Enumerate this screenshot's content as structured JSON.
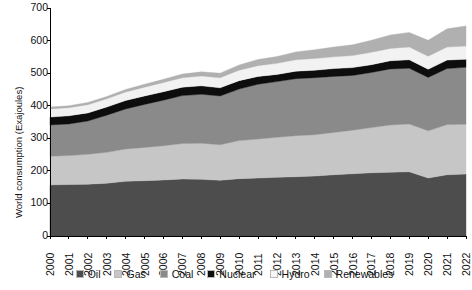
{
  "chart_data": {
    "type": "area",
    "stacked": true,
    "title": "",
    "xlabel": "",
    "ylabel": "World consumption (Exajoules)",
    "ylim": [
      0,
      700
    ],
    "yticks": [
      0,
      100,
      200,
      300,
      400,
      500,
      600,
      700
    ],
    "grid": false,
    "legend_position": "bottom",
    "x": [
      2000,
      2001,
      2002,
      2003,
      2004,
      2005,
      2006,
      2007,
      2008,
      2009,
      2010,
      2011,
      2012,
      2013,
      2014,
      2015,
      2016,
      2017,
      2018,
      2019,
      2020,
      2021,
      2022
    ],
    "categories": [
      "2000",
      "2001",
      "2002",
      "2003",
      "2004",
      "2005",
      "2006",
      "2007",
      "2008",
      "2009",
      "2010",
      "2011",
      "2012",
      "2013",
      "2014",
      "2015",
      "2016",
      "2017",
      "2018",
      "2019",
      "2020",
      "2021",
      "2022"
    ],
    "series": [
      {
        "name": "Oil",
        "color": "#4d4d4d",
        "values": [
          157,
          158,
          159,
          162,
          168,
          170,
          172,
          175,
          174,
          171,
          176,
          178,
          180,
          182,
          184,
          188,
          191,
          194,
          196,
          197,
          178,
          188,
          190
        ]
      },
      {
        "name": "Gas",
        "color": "#c6c6c6",
        "values": [
          88,
          89,
          92,
          95,
          99,
          102,
          105,
          109,
          111,
          109,
          117,
          120,
          123,
          126,
          127,
          130,
          134,
          139,
          145,
          147,
          145,
          154,
          153
        ]
      },
      {
        "name": "Coal",
        "color": "#8a8a8a",
        "values": [
          96,
          97,
          102,
          114,
          123,
          132,
          140,
          147,
          150,
          150,
          158,
          168,
          171,
          175,
          175,
          172,
          168,
          169,
          172,
          171,
          164,
          172,
          175
        ]
      },
      {
        "name": "Nuclear",
        "color": "#0d0d0d",
        "values": [
          24,
          25,
          25,
          25,
          26,
          26,
          26,
          26,
          26,
          25,
          26,
          24,
          22,
          23,
          23,
          24,
          24,
          24,
          25,
          26,
          25,
          26,
          25
        ]
      },
      {
        "name": "Hydro",
        "color": "#f2f2f2",
        "values": [
          25,
          25,
          25,
          25,
          26,
          27,
          28,
          29,
          30,
          31,
          32,
          33,
          34,
          35,
          36,
          36,
          37,
          38,
          38,
          39,
          40,
          40,
          40
        ]
      },
      {
        "name": "Renewables",
        "color": "#b0b0b0",
        "values": [
          6,
          6,
          7,
          7,
          8,
          9,
          10,
          11,
          13,
          14,
          16,
          19,
          21,
          24,
          27,
          30,
          33,
          37,
          41,
          45,
          49,
          56,
          62
        ]
      }
    ]
  },
  "axes": {
    "ylabel": "World consumption (Exajoules)",
    "ytick_labels": [
      "700",
      "600",
      "500",
      "400",
      "300",
      "200",
      "100",
      "0"
    ],
    "xtick_labels": [
      "2000",
      "2001",
      "2002",
      "2003",
      "2004",
      "2005",
      "2006",
      "2007",
      "2008",
      "2009",
      "2010",
      "2011",
      "2012",
      "2013",
      "2014",
      "2015",
      "2016",
      "2017",
      "2018",
      "2019",
      "2020",
      "2021",
      "2022"
    ]
  },
  "legend": {
    "items": [
      {
        "label": "Oil",
        "color": "#4d4d4d"
      },
      {
        "label": "Gas",
        "color": "#c6c6c6"
      },
      {
        "label": "Coal",
        "color": "#8a8a8a"
      },
      {
        "label": "Nuclear",
        "color": "#0d0d0d"
      },
      {
        "label": "Hydro",
        "color": "#f7f7f7"
      },
      {
        "label": "Renewables",
        "color": "#b0b0b0"
      }
    ]
  }
}
